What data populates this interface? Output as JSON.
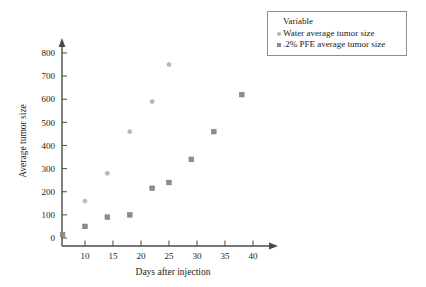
{
  "chart_data": {
    "type": "scatter",
    "title": "",
    "xlabel": "Days after injection",
    "ylabel": "Average tumor size",
    "xlim": [
      0,
      44
    ],
    "ylim": [
      0,
      870
    ],
    "xticks": [
      10,
      15,
      20,
      25,
      30,
      35,
      40
    ],
    "yticks": [
      0,
      100,
      200,
      300,
      400,
      500,
      600,
      700,
      800
    ],
    "grid": false,
    "legend_position": "top-right",
    "legend_title": "Variable",
    "series": [
      {
        "name": "Water average tumor size",
        "marker": "circle",
        "color": "#b9b9b9",
        "points": [
          {
            "x": 10,
            "y": 160
          },
          {
            "x": 14,
            "y": 280
          },
          {
            "x": 18,
            "y": 460
          },
          {
            "x": 22,
            "y": 590
          },
          {
            "x": 25,
            "y": 750
          }
        ]
      },
      {
        "name": ".2% PFE average tumor size",
        "marker": "square",
        "color": "#8c8c8c",
        "points": [
          {
            "x": 6,
            "y": 15
          },
          {
            "x": 10,
            "y": 50
          },
          {
            "x": 14,
            "y": 90
          },
          {
            "x": 18,
            "y": 100
          },
          {
            "x": 22,
            "y": 215
          },
          {
            "x": 25,
            "y": 240
          },
          {
            "x": 29,
            "y": 340
          },
          {
            "x": 33,
            "y": 460
          },
          {
            "x": 38,
            "y": 620
          }
        ]
      }
    ]
  },
  "legend": {
    "title": "Variable",
    "entries": [
      {
        "label": "Water average tumor size",
        "marker": "circle-marker-icon"
      },
      {
        "label": ".2% PFE average tumor size",
        "marker": "square-marker-icon"
      }
    ]
  },
  "axes": {
    "x_title": "Days after injection",
    "y_title": "Average tumor size",
    "x_tick_labels": [
      "10",
      "15",
      "20",
      "25",
      "30",
      "35",
      "40"
    ],
    "y_tick_labels": [
      "0",
      "100",
      "200",
      "300",
      "400",
      "500",
      "600",
      "700",
      "800"
    ]
  },
  "colors": {
    "axis": "#4a4a4a",
    "series_water": "#b9b9b9",
    "series_pfe": "#8c8c8c",
    "background": "#ffffff"
  }
}
